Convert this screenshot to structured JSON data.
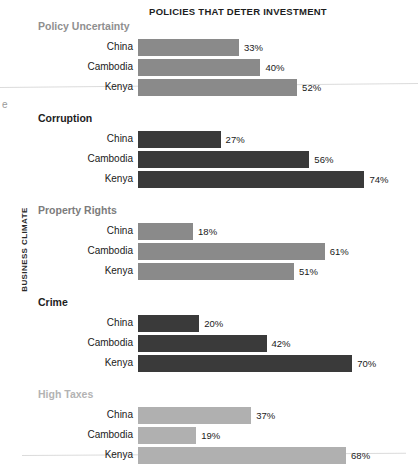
{
  "chart_data": {
    "type": "bar",
    "title": "POLICIES THAT DETER INVESTMENT",
    "xlabel": "",
    "ylabel": "BUSINESS CLIMATE",
    "orientation": "horizontal",
    "xlim": [
      0,
      100
    ],
    "grid": false,
    "legend": "none",
    "value_suffix": "%",
    "categories": [
      "China",
      "Cambodia",
      "Kenya"
    ],
    "groups": [
      {
        "name": "Policy Uncertainty",
        "header_color": "#8f8f8f",
        "bar_color": "#8a8a8a",
        "values": [
          33,
          40,
          52
        ],
        "labels": [
          "33%",
          "40%",
          "52%"
        ]
      },
      {
        "name": "Corruption",
        "header_color": "#1d1d1d",
        "bar_color": "#3a3a3a",
        "values": [
          27,
          56,
          74
        ],
        "labels": [
          "27%",
          "56%",
          "74%"
        ]
      },
      {
        "name": "Property Rights",
        "header_color": "#7c7c7c",
        "bar_color": "#8a8a8a",
        "values": [
          18,
          61,
          51
        ],
        "labels": [
          "18%",
          "61%",
          "51%"
        ]
      },
      {
        "name": "Crime",
        "header_color": "#1d1d1d",
        "bar_color": "#3a3a3a",
        "values": [
          20,
          42,
          70
        ],
        "labels": [
          "20%",
          "42%",
          "70%"
        ]
      },
      {
        "name": "High Taxes",
        "header_color": "#b3b3b3",
        "bar_color": "#b0b0b0",
        "values": [
          37,
          19,
          68
        ],
        "labels": [
          "37%",
          "19%",
          "68%"
        ]
      }
    ]
  },
  "page": {
    "edge_mark": "e"
  }
}
